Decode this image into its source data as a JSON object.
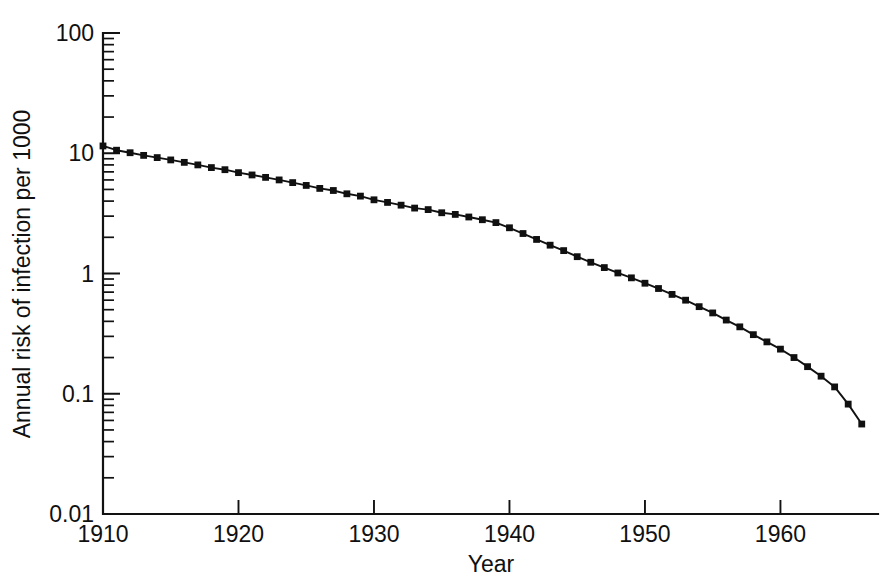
{
  "chart_data": {
    "type": "line",
    "title": "",
    "xlabel": "Year",
    "ylabel": "Annual risk of infection per 1000",
    "yscale": "log",
    "xlim": [
      1910,
      1966
    ],
    "ylim": [
      0.01,
      100
    ],
    "grid": false,
    "legend": null,
    "y_tick_labels": [
      "100",
      "10",
      "1",
      "0.1",
      "0.01"
    ],
    "y_tick_values": [
      100,
      10,
      1,
      0.1,
      0.01
    ],
    "x_tick_labels": [
      "1910",
      "1920",
      "1930",
      "1940",
      "1950",
      "1960"
    ],
    "x_tick_values": [
      1910,
      1920,
      1930,
      1940,
      1950,
      1960
    ],
    "marker": "square",
    "series": [
      {
        "name": "Annual risk of infection",
        "x": [
          1910,
          1911,
          1912,
          1913,
          1914,
          1915,
          1916,
          1917,
          1918,
          1919,
          1920,
          1921,
          1922,
          1923,
          1924,
          1925,
          1926,
          1927,
          1928,
          1929,
          1930,
          1931,
          1932,
          1933,
          1934,
          1935,
          1936,
          1937,
          1938,
          1939,
          1940,
          1941,
          1942,
          1943,
          1944,
          1945,
          1946,
          1947,
          1948,
          1949,
          1950,
          1951,
          1952,
          1953,
          1954,
          1955,
          1956,
          1957,
          1958,
          1959,
          1960,
          1961,
          1962,
          1963,
          1964,
          1965,
          1966
        ],
        "values": [
          11.5,
          10.6,
          10.1,
          9.6,
          9.2,
          8.8,
          8.4,
          8.0,
          7.6,
          7.3,
          6.9,
          6.6,
          6.3,
          6.0,
          5.7,
          5.4,
          5.1,
          4.9,
          4.6,
          4.4,
          4.1,
          3.9,
          3.7,
          3.5,
          3.4,
          3.2,
          3.1,
          2.95,
          2.8,
          2.65,
          2.4,
          2.15,
          1.92,
          1.72,
          1.55,
          1.38,
          1.24,
          1.12,
          1.01,
          0.92,
          0.83,
          0.75,
          0.67,
          0.6,
          0.53,
          0.47,
          0.41,
          0.36,
          0.31,
          0.27,
          0.235,
          0.2,
          0.168,
          0.14,
          0.114,
          0.082,
          0.056
        ]
      }
    ]
  }
}
